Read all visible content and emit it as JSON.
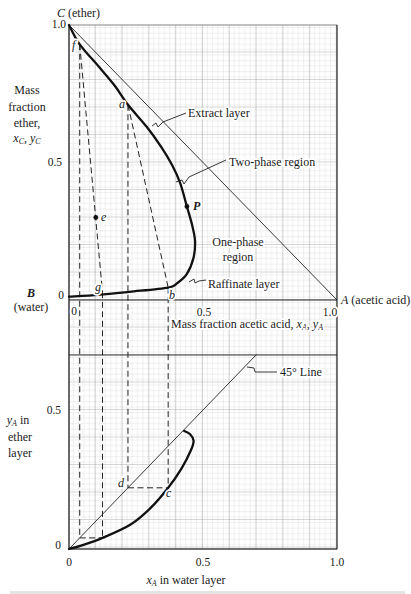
{
  "top_chart": {
    "vertex_C": {
      "symbol": "C",
      "name": "(ether)"
    },
    "vertex_B": {
      "symbol": "B",
      "name": "(water)"
    },
    "vertex_A": {
      "symbol": "A",
      "name": "(acetic acid)"
    },
    "y_ticks": {
      "t1": "1.0",
      "t05": "0.5",
      "t0": "0"
    },
    "x_ticks": {
      "t0": "0",
      "t05": "0.5",
      "t1": "1.0"
    },
    "ylabel": {
      "line1": "Mass",
      "line2": "fraction",
      "line3": "ether,",
      "v1": "x",
      "s1": "C",
      "sep": ", ",
      "v2": "y",
      "s2": "C"
    },
    "xlabel": {
      "text": "Mass fraction acetic acid, ",
      "v1": "x",
      "s1": "A",
      "sep": ", ",
      "v2": "y",
      "s2": "A"
    },
    "annotations": {
      "extract_layer": "Extract layer",
      "two_phase_region": "Two-phase region",
      "one_phase_line1": "One-phase",
      "one_phase_line2": "region",
      "raffinate_layer": "Raffinate layer"
    },
    "point_labels": {
      "f": "f",
      "a": "a",
      "e": "e",
      "P": "P",
      "g": "g",
      "b": "b"
    }
  },
  "bottom_chart": {
    "y_ticks": {
      "t05": "0.5",
      "t0": "0"
    },
    "x_ticks": {
      "t0": "0",
      "t05": "0.5",
      "t1": "1.0"
    },
    "ylabel": {
      "v": "y",
      "s": "A",
      "line1_rest": " in",
      "line2": "ether",
      "line3": "layer"
    },
    "xlabel": {
      "v": "x",
      "s": "A",
      "rest": " in water layer"
    },
    "annotations": {
      "line_45": "45° Line"
    },
    "point_labels": {
      "d": "d",
      "c": "c"
    }
  },
  "chart_data": [
    {
      "type": "line",
      "subtype": "right-triangle ternary phase diagram",
      "title": "",
      "xlabel": "Mass fraction acetic acid, x_A, y_A",
      "ylabel": "Mass fraction ether, x_C, y_C",
      "xlim": [
        0,
        1.0
      ],
      "ylim": [
        0,
        1.0
      ],
      "xticks": [
        0,
        0.5,
        1.0
      ],
      "yticks": [
        0,
        0.5,
        1.0
      ],
      "grid": true,
      "vertices": {
        "B (water)": [
          0,
          0
        ],
        "A (acetic acid)": [
          1,
          0
        ],
        "C (ether)": [
          0,
          1
        ]
      },
      "series": [
        {
          "name": "Phase envelope (extract layer - plait - raffinate layer)",
          "style": "thick",
          "smooth": true,
          "points": [
            [
              0.0,
              1.0
            ],
            [
              0.04,
              0.93
            ],
            [
              0.11,
              0.85
            ],
            [
              0.17,
              0.78
            ],
            [
              0.22,
              0.71
            ],
            [
              0.29,
              0.63
            ],
            [
              0.345,
              0.555
            ],
            [
              0.385,
              0.49
            ],
            [
              0.415,
              0.425
            ],
            [
              0.44,
              0.34
            ],
            [
              0.46,
              0.27
            ],
            [
              0.47,
              0.215
            ],
            [
              0.465,
              0.155
            ],
            [
              0.44,
              0.095
            ],
            [
              0.405,
              0.062
            ],
            [
              0.37,
              0.045
            ],
            [
              0.225,
              0.03
            ],
            [
              0.11,
              0.019
            ],
            [
              0.0,
              0.012
            ]
          ]
        },
        {
          "name": "Hypotenuse C-A",
          "style": "thin",
          "smooth": false,
          "points": [
            [
              0,
              1
            ],
            [
              1,
              0
            ]
          ]
        },
        {
          "name": "Tie line f-g",
          "style": "dash",
          "smooth": false,
          "points": [
            [
              0.04,
              0.93
            ],
            [
              0.125,
              0.028
            ]
          ]
        },
        {
          "name": "Tie line a-b",
          "style": "dash",
          "smooth": false,
          "points": [
            [
              0.22,
              0.71
            ],
            [
              0.37,
              0.045
            ]
          ]
        }
      ],
      "points": [
        {
          "label": "f",
          "x": 0.04,
          "y": 0.93
        },
        {
          "label": "a",
          "x": 0.22,
          "y": 0.71
        },
        {
          "label": "e",
          "x": 0.1,
          "y": 0.3
        },
        {
          "label": "P",
          "x": 0.44,
          "y": 0.34
        },
        {
          "label": "g",
          "x": 0.125,
          "y": 0.028
        },
        {
          "label": "b",
          "x": 0.37,
          "y": 0.045
        }
      ],
      "annotations": [
        "Extract layer",
        "Two-phase region",
        "One-phase region",
        "Raffinate layer"
      ]
    },
    {
      "type": "line",
      "title": "",
      "xlabel": "x_A in water layer",
      "ylabel": "y_A in ether layer",
      "xlim": [
        0,
        1.0
      ],
      "ylim": [
        0,
        0.7
      ],
      "xticks": [
        0,
        0.5,
        1.0
      ],
      "yticks": [
        0,
        0.5
      ],
      "grid": true,
      "series": [
        {
          "name": "Distribution curve",
          "style": "thick",
          "smooth": true,
          "points": [
            [
              0,
              0
            ],
            [
              0.045,
              0.012
            ],
            [
              0.125,
              0.04
            ],
            [
              0.23,
              0.088
            ],
            [
              0.305,
              0.148
            ],
            [
              0.37,
              0.22
            ],
            [
              0.42,
              0.29
            ],
            [
              0.455,
              0.355
            ],
            [
              0.465,
              0.39
            ],
            [
              0.452,
              0.413
            ],
            [
              0.43,
              0.425
            ]
          ]
        },
        {
          "name": "45° Line",
          "style": "thin",
          "smooth": false,
          "points": [
            [
              0,
              0
            ],
            [
              0.7,
              0.7
            ]
          ]
        },
        {
          "name": "Construction g (x=0.125, y=0.04)",
          "style": "dash",
          "smooth": false,
          "points": [
            [
              0.04,
              0.04
            ],
            [
              0.125,
              0.04
            ]
          ]
        },
        {
          "name": "Construction d-c",
          "style": "dash",
          "smooth": false,
          "points": [
            [
              0.22,
              0.22
            ],
            [
              0.37,
              0.22
            ]
          ]
        }
      ],
      "points": [
        {
          "label": "d",
          "x": 0.22,
          "y": 0.22
        },
        {
          "label": "c",
          "x": 0.37,
          "y": 0.22
        }
      ]
    }
  ],
  "projections": [
    {
      "from": "f",
      "x": 0.04,
      "top_y": 0.93,
      "bottom_y": 0.04
    },
    {
      "from": "g",
      "x": 0.125,
      "top_y": 0.028,
      "bottom_y": 0.04
    },
    {
      "from": "a",
      "x": 0.22,
      "top_y": 0.71,
      "bottom_y": 0.22
    },
    {
      "from": "b",
      "x": 0.37,
      "top_y": 0.045,
      "bottom_y": 0.22
    }
  ]
}
